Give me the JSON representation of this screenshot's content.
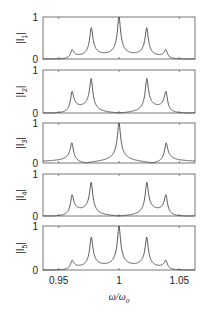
{
  "chart_data": {
    "type": "line",
    "title": "",
    "xlabel": "ω/ω0",
    "xlabel_main": "ω/ω",
    "xlabel_sub": "0",
    "xlim": [
      0.937,
      1.063
    ],
    "xticks": [
      0.95,
      1,
      1.05
    ],
    "xtick_labels": [
      "0.95",
      "1",
      "1.05"
    ],
    "grid": false,
    "legend": null,
    "resonances": [
      0.961,
      0.977,
      1.0,
      1.023,
      1.039
    ],
    "linewidth_halfwidth": 0.0012,
    "panels": [
      {
        "ylabel": "|I1|",
        "ylabel_main": "|I",
        "ylabel_sub": "1",
        "ylim": [
          0,
          1
        ],
        "yticks": [
          0,
          1
        ],
        "peak_heights": [
          0.22,
          0.75,
          1.0,
          0.75,
          0.22
        ]
      },
      {
        "ylabel": "|I2|",
        "ylabel_main": "|I",
        "ylabel_sub": "2",
        "ylim": [
          0,
          1
        ],
        "yticks": [
          0,
          1
        ],
        "peak_heights": [
          0.5,
          0.8,
          0.0,
          0.8,
          0.5
        ]
      },
      {
        "ylabel": "|I3|",
        "ylabel_main": "|I",
        "ylabel_sub": "3",
        "ylim": [
          0,
          1
        ],
        "yticks": [
          0,
          1
        ],
        "peak_heights": [
          0.5,
          0.0,
          1.0,
          0.0,
          0.5
        ]
      },
      {
        "ylabel": "|I4|",
        "ylabel_main": "|I",
        "ylabel_sub": "4",
        "ylim": [
          0,
          1
        ],
        "yticks": [
          0,
          1
        ],
        "peak_heights": [
          0.5,
          0.8,
          0.0,
          0.8,
          0.5
        ]
      },
      {
        "ylabel": "|I5|",
        "ylabel_main": "|I",
        "ylabel_sub": "5",
        "ylim": [
          0,
          1
        ],
        "yticks": [
          0,
          1
        ],
        "peak_heights": [
          0.22,
          0.75,
          1.0,
          0.75,
          0.22
        ]
      }
    ]
  },
  "style": {
    "line_color": "#444444",
    "axis_color": "#555555"
  }
}
